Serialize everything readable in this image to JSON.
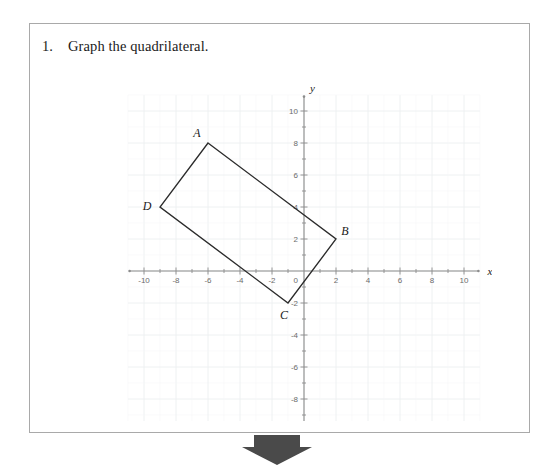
{
  "problem": {
    "number": "1.",
    "prompt": "Graph the quadrilateral."
  },
  "graph": {
    "x_axis_label": "x",
    "y_axis_label": "y",
    "x_ticks": [
      "-10",
      "-8",
      "-6",
      "-4",
      "-2",
      "0",
      "2",
      "4",
      "6",
      "8",
      "10"
    ],
    "y_ticks": [
      "10",
      "8",
      "6",
      "4",
      "2",
      "-2",
      "-4",
      "-6",
      "-8",
      "-10"
    ],
    "origin_label": "0",
    "vertices": [
      {
        "label": "A",
        "x": -6,
        "y": 8
      },
      {
        "label": "B",
        "x": 2,
        "y": 2
      },
      {
        "label": "C",
        "x": -1,
        "y": -2
      },
      {
        "label": "D",
        "x": -9,
        "y": 4
      }
    ]
  },
  "arrow": {
    "name": "down-arrow",
    "color": "#4a4a4a"
  },
  "chart_data": {
    "type": "scatter",
    "title": "",
    "xlabel": "x",
    "ylabel": "y",
    "xlim": [
      -11,
      11
    ],
    "ylim": [
      -11,
      11
    ],
    "grid": true,
    "grid_step": 1,
    "major_step": 2,
    "legend": "none",
    "series": [
      {
        "name": "quadrilateral ABCD",
        "closed": true,
        "point_labels": [
          "A",
          "B",
          "C",
          "D"
        ],
        "x": [
          -6,
          2,
          -1,
          -9
        ],
        "y": [
          8,
          2,
          -2,
          4
        ]
      }
    ],
    "annotations": [
      {
        "text": "A",
        "x": -6,
        "y": 8
      },
      {
        "text": "B",
        "x": 2,
        "y": 2
      },
      {
        "text": "C",
        "x": -1,
        "y": -2
      },
      {
        "text": "D",
        "x": -9,
        "y": 4
      }
    ]
  }
}
